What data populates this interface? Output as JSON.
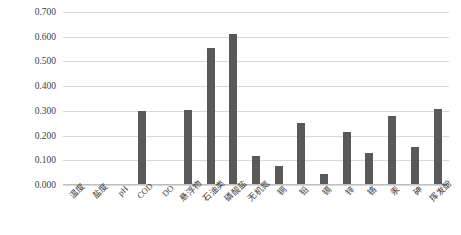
{
  "chart_data": {
    "type": "bar",
    "title": "",
    "xlabel": "",
    "ylabel": "",
    "ylim": [
      0.0,
      0.7
    ],
    "grid": true,
    "legend": false,
    "bar_color": "#595959",
    "gridline_color": "#D9D9D9",
    "ytick_labels": [
      "0.700",
      "0.600",
      "0.500",
      "0.400",
      "0.300",
      "0.200",
      "0.100",
      "0.000"
    ],
    "ytick_values": [
      0.7,
      0.6,
      0.5,
      0.4,
      0.3,
      0.2,
      0.1,
      0.0
    ],
    "categories": [
      "温度",
      "盐度",
      "pH",
      "COD",
      "DO",
      "悬浮物",
      "石油类",
      "磷酸盐",
      "无机氮",
      "铜",
      "铅",
      "镉",
      "锌",
      "铬",
      "汞",
      "砷",
      "挥发酚"
    ],
    "values": [
      0.004,
      0.004,
      0.004,
      0.3,
      0.004,
      0.302,
      0.555,
      0.61,
      0.118,
      0.076,
      0.25,
      0.046,
      0.215,
      0.131,
      0.279,
      0.152,
      0.308
    ]
  }
}
